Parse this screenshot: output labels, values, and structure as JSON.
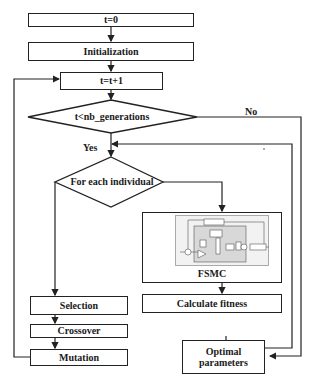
{
  "diagram": {
    "type": "flowchart",
    "nodes": {
      "start": "t=0",
      "init": "Initialization",
      "increment": "t=t+1",
      "condition": "t<nb_generations",
      "loop": "For each individual",
      "fsmc": "FSMC",
      "fitness": "Calculate fitness",
      "selection": "Selection",
      "crossover": "Crossover",
      "mutation": "Mutation",
      "result": "Optimal parameters"
    },
    "edge_labels": {
      "yes": "Yes",
      "no": "No"
    },
    "edges": [
      {
        "from": "start",
        "to": "init"
      },
      {
        "from": "init",
        "to": "increment"
      },
      {
        "from": "increment",
        "to": "condition"
      },
      {
        "from": "condition",
        "to": "loop",
        "label": "Yes"
      },
      {
        "from": "condition",
        "to": "result",
        "label": "No"
      },
      {
        "from": "loop",
        "to": "fsmc"
      },
      {
        "from": "fsmc",
        "to": "fitness"
      },
      {
        "from": "fitness",
        "to": "loop"
      },
      {
        "from": "loop",
        "to": "selection"
      },
      {
        "from": "selection",
        "to": "crossover"
      },
      {
        "from": "crossover",
        "to": "mutation"
      },
      {
        "from": "mutation",
        "to": "increment"
      }
    ],
    "colors": {
      "stroke": "#222222",
      "background": "#ffffff",
      "fsmc_image_fill": "#f2f2f2"
    }
  }
}
